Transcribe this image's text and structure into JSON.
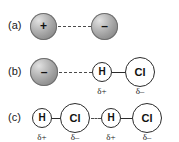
{
  "figure": {
    "background_color": "#ffffff",
    "sphere_colors": {
      "highlight": "#e2e2e2",
      "midtone": "#9a9a9a",
      "shadow": "#7c7c7c",
      "rim": "#6e6e6e"
    },
    "atom_colors": {
      "fill": "#ffffff",
      "stroke": "#2b2b2b"
    },
    "rows": [
      {
        "label": "(a)",
        "items": {
          "ion_left_charge": "+",
          "ion_right_charge": "–"
        }
      },
      {
        "label": "(b)",
        "items": {
          "ion_charge": "–",
          "atom_h": "H",
          "atom_cl": "Cl",
          "delta_h": "δ+",
          "delta_cl": "δ–"
        }
      },
      {
        "label": "(c)",
        "items": {
          "atom_h_1": "H",
          "atom_cl_1": "Cl",
          "atom_h_2": "H",
          "atom_cl_2": "Cl",
          "delta_h_1": "δ+",
          "delta_cl_1": "δ–",
          "delta_h_2": "δ+",
          "delta_cl_2": "δ–"
        }
      }
    ]
  }
}
